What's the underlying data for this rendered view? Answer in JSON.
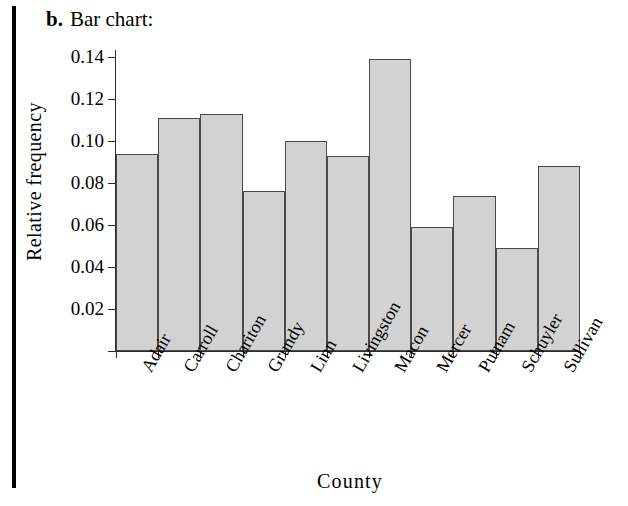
{
  "figure": {
    "part_label": "b.",
    "part_title": "Bar chart:"
  },
  "chart_data": {
    "type": "bar",
    "title": "",
    "xlabel": "County",
    "ylabel": "Relative frequency",
    "categories": [
      "Adair",
      "Carroll",
      "Chariton",
      "Grundy",
      "Linn",
      "Livingston",
      "Macon",
      "Mercer",
      "Putnam",
      "Schuyler",
      "Sullivan"
    ],
    "values": [
      0.094,
      0.111,
      0.113,
      0.076,
      0.1,
      0.093,
      0.139,
      0.059,
      0.074,
      0.049,
      0.088
    ],
    "ylim": [
      0,
      0.145
    ],
    "yticks": [
      0.02,
      0.04,
      0.06,
      0.08,
      0.1,
      0.12,
      0.14
    ],
    "ytick_labels": [
      "0.02",
      "0.04",
      "0.06",
      "0.08",
      "0.10",
      "0.12",
      "0.14"
    ],
    "grid": false,
    "legend": "none",
    "bar_fill_color": "#d2d2d2",
    "bar_edge_color": "#4a4a4a",
    "axis_color": "#2b2b2b"
  }
}
